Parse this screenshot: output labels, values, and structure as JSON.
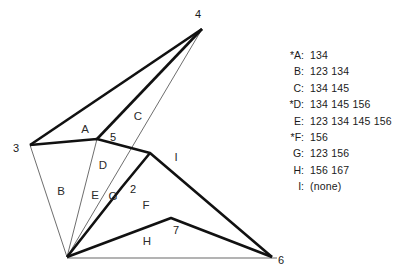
{
  "figure": {
    "type": "geometric-region-diagram",
    "vertex_labels": [
      {
        "name": "4",
        "x": 198,
        "y": 18
      },
      {
        "name": "3",
        "x": 16,
        "y": 152
      },
      {
        "name": "6",
        "x": 281,
        "y": 264
      },
      {
        "name": "5",
        "x": 113,
        "y": 141
      },
      {
        "name": "2",
        "x": 133,
        "y": 193
      },
      {
        "name": "7",
        "x": 176,
        "y": 234
      }
    ],
    "region_labels": [
      {
        "name": "A",
        "x": 85,
        "y": 133
      },
      {
        "name": "B",
        "x": 61,
        "y": 195
      },
      {
        "name": "C",
        "x": 138,
        "y": 120
      },
      {
        "name": "D",
        "x": 103,
        "y": 169
      },
      {
        "name": "E",
        "x": 95,
        "y": 199
      },
      {
        "name": "G",
        "x": 113,
        "y": 200
      },
      {
        "name": "F",
        "x": 146,
        "y": 209
      },
      {
        "name": "H",
        "x": 147,
        "y": 245
      },
      {
        "name": "I",
        "x": 176,
        "y": 161
      }
    ],
    "colors": {
      "thick_stroke": "#111111",
      "thin_stroke": "#6e6e6e",
      "baseline_stroke": "#9a9a9a",
      "text": "#1a1a1a"
    },
    "points": {
      "v4": [
        202,
        29
      ],
      "v3": [
        30,
        145
      ],
      "v6": [
        272,
        257
      ],
      "hub": [
        67,
        257
      ],
      "v5": [
        97,
        139
      ],
      "v2": [
        122,
        187
      ],
      "v7": [
        171,
        218
      ],
      "d_mid": [
        150,
        153
      ]
    }
  },
  "legend": {
    "rows": [
      {
        "key": "*A:",
        "value": "134"
      },
      {
        "key": "B:",
        "value": "123 134"
      },
      {
        "key": "C:",
        "value": "134 145"
      },
      {
        "key": "*D:",
        "value": "134 145 156"
      },
      {
        "key": "E:",
        "value": "123 134 145 156"
      },
      {
        "key": "*F:",
        "value": "156"
      },
      {
        "key": "G:",
        "value": "123 156"
      },
      {
        "key": "H:",
        "value": "156 167"
      },
      {
        "key": "I:",
        "value": "(none)"
      }
    ]
  }
}
